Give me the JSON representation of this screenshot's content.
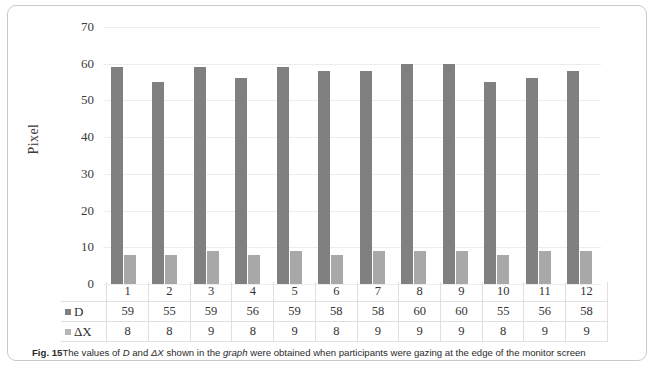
{
  "figure": {
    "caption_label": "Fig. 15",
    "caption_part1": "The values of ",
    "caption_d": "D",
    "caption_and": " and ",
    "caption_dx": "ΔX",
    "caption_part2": " shown in the ",
    "caption_graph": "graph",
    "caption_part3": " were obtained when participants were gazing at the edge of the monitor screen"
  },
  "chart_data": {
    "type": "bar",
    "title": "",
    "xlabel": "",
    "ylabel": "Pixel",
    "ylim": [
      0,
      70
    ],
    "ytick_step": 10,
    "yticks": [
      "70",
      "60",
      "50",
      "40",
      "30",
      "20",
      "10",
      "0"
    ],
    "grid": true,
    "legend_position": "data-table-row-labels",
    "categories": [
      "1",
      "2",
      "3",
      "4",
      "5",
      "6",
      "7",
      "8",
      "9",
      "10",
      "11",
      "12"
    ],
    "series": [
      {
        "name": "D",
        "color": "#808080",
        "values": [
          59,
          55,
          59,
          56,
          59,
          58,
          58,
          60,
          60,
          55,
          56,
          58
        ]
      },
      {
        "name": "ΔX",
        "color": "#a8a8a8",
        "values": [
          8,
          8,
          9,
          8,
          9,
          8,
          9,
          9,
          9,
          8,
          9,
          9
        ]
      }
    ]
  },
  "colors": {
    "series_d": "#808080",
    "series_dx": "#a8a8a8",
    "gridline": "#ececec",
    "frame": "#c9c9c9",
    "table_border": "#dfdfdf"
  }
}
